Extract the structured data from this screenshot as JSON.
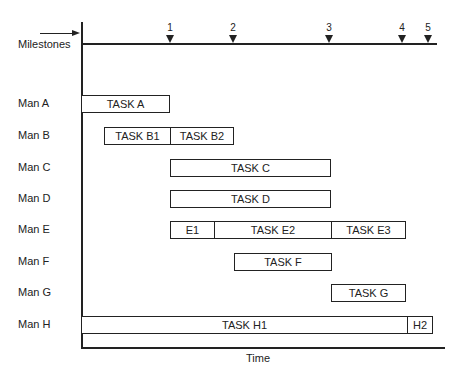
{
  "milestones": {
    "label": "Milestones",
    "items": [
      {
        "num": "1",
        "x": 170
      },
      {
        "num": "2",
        "x": 233
      },
      {
        "num": "3",
        "x": 329
      },
      {
        "num": "4",
        "x": 402
      },
      {
        "num": "5",
        "x": 428
      }
    ]
  },
  "rows": [
    {
      "label": "Man A",
      "y": 104
    },
    {
      "label": "Man B",
      "y": 136
    },
    {
      "label": "Man C",
      "y": 168
    },
    {
      "label": "Man D",
      "y": 199
    },
    {
      "label": "Man E",
      "y": 230
    },
    {
      "label": "Man F",
      "y": 262
    },
    {
      "label": "Man G",
      "y": 293
    },
    {
      "label": "Man H",
      "y": 325
    }
  ],
  "tasks": [
    {
      "label": "TASK A",
      "row": 0,
      "x1": 81,
      "x2": 170
    },
    {
      "label": "TASK B1",
      "row": 1,
      "x1": 104,
      "x2": 171
    },
    {
      "label": "TASK B2",
      "row": 1,
      "x1": 170,
      "x2": 234
    },
    {
      "label": "TASK C",
      "row": 2,
      "x1": 170,
      "x2": 331
    },
    {
      "label": "TASK D",
      "row": 3,
      "x1": 170,
      "x2": 331
    },
    {
      "label": "E1",
      "row": 4,
      "x1": 170,
      "x2": 215
    },
    {
      "label": "TASK E2",
      "row": 4,
      "x1": 214,
      "x2": 332
    },
    {
      "label": "TASK E3",
      "row": 4,
      "x1": 331,
      "x2": 406
    },
    {
      "label": "TASK F",
      "row": 5,
      "x1": 234,
      "x2": 332
    },
    {
      "label": "TASK G",
      "row": 6,
      "x1": 331,
      "x2": 406
    },
    {
      "label": "TASK H1",
      "row": 7,
      "x1": 81,
      "x2": 408
    },
    {
      "label": "H2",
      "row": 7,
      "x1": 407,
      "x2": 433
    }
  ],
  "axis": {
    "x_label": "Time"
  }
}
